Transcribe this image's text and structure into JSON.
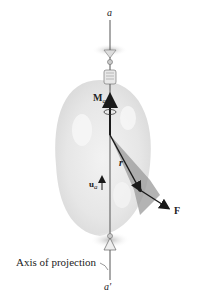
{
  "diagram": {
    "type": "moment-about-axis",
    "labels": {
      "axis_top": "a",
      "axis_bottom": "a′",
      "moment": "M",
      "moment_sub": "a",
      "unit_vector": "u",
      "unit_vector_sub": "a",
      "position_vector": "r",
      "force": "F",
      "axis_caption": "Axis of projection"
    },
    "colors": {
      "vector": "#1a1a1a",
      "body_fill": "#d9d9d9",
      "shadow": "#9a9a9a",
      "axis_line": "#555555"
    }
  }
}
